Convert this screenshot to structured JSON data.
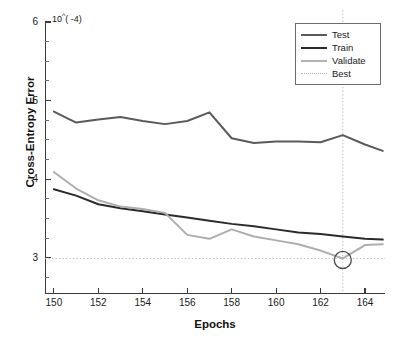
{
  "chart_data": {
    "type": "line",
    "title": "",
    "xlabel": "Epochs",
    "ylabel": "Cross-Entropy Error",
    "y_multiplier": "10^(-4)",
    "y_multiplier_base": "10",
    "y_multiplier_exp": "( -4)",
    "xlim": [
      149.6,
      164.9
    ],
    "ylim": [
      2.55,
      6.0
    ],
    "xticks": [
      150,
      152,
      154,
      156,
      158,
      160,
      162,
      164
    ],
    "yticks": [
      3,
      4,
      5,
      6
    ],
    "y_minor_ticks": [
      2.75,
      3.25,
      3.5,
      3.75,
      4.25,
      4.5,
      4.75,
      5.25,
      5.5,
      5.75
    ],
    "grid": false,
    "legend_position": "top-right",
    "x": [
      150,
      151,
      152,
      153,
      154,
      155,
      156,
      157,
      158,
      159,
      160,
      161,
      162,
      163,
      164,
      164.8
    ],
    "series": [
      {
        "name": "Test",
        "color": "#5a5a5a",
        "width": 2.0,
        "values": [
          4.86,
          4.72,
          4.76,
          4.79,
          4.74,
          4.7,
          4.74,
          4.85,
          4.52,
          4.46,
          4.48,
          4.48,
          4.47,
          4.56,
          4.44,
          4.36
        ]
      },
      {
        "name": "Train",
        "color": "#2b2b2b",
        "width": 2.0,
        "values": [
          3.87,
          3.79,
          3.68,
          3.63,
          3.59,
          3.55,
          3.51,
          3.47,
          3.43,
          3.4,
          3.36,
          3.32,
          3.3,
          3.27,
          3.24,
          3.23
        ]
      },
      {
        "name": "Validate",
        "color": "#aeaeae",
        "width": 2.0,
        "values": [
          4.09,
          3.88,
          3.73,
          3.65,
          3.62,
          3.57,
          3.29,
          3.24,
          3.36,
          3.27,
          3.22,
          3.17,
          3.09,
          2.99,
          3.16,
          3.17
        ]
      }
    ],
    "best": {
      "name": "Best",
      "color": "#bdbdbd",
      "style": "dotted",
      "epoch": 163,
      "value": 2.99,
      "marker": "circle",
      "marker_color": "#4a4a4a"
    },
    "legend": [
      {
        "label": "Test",
        "color": "#5a5a5a",
        "style": "solid",
        "width": 2.2
      },
      {
        "label": "Train",
        "color": "#2b2b2b",
        "style": "solid",
        "width": 2.4
      },
      {
        "label": "Validate",
        "color": "#b2b2b2",
        "style": "solid",
        "width": 2.2
      },
      {
        "label": "Best",
        "color": "#bdbdbd",
        "style": "dotted",
        "width": 1.4
      }
    ]
  }
}
